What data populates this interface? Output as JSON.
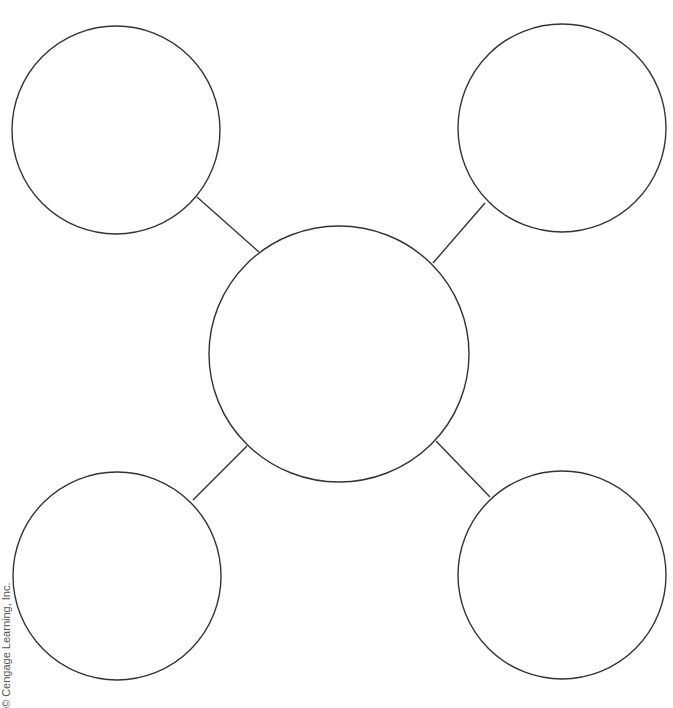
{
  "diagram": {
    "type": "spider-map",
    "stroke_color": "#333333",
    "background": "#ffffff",
    "center_node": {
      "cx": 339,
      "cy": 354,
      "rx": 130,
      "ry": 128,
      "label": ""
    },
    "outer_nodes": [
      {
        "position": "top-left",
        "cx": 116,
        "cy": 130,
        "r": 104,
        "label": ""
      },
      {
        "position": "top-right",
        "cx": 562,
        "cy": 128,
        "r": 104,
        "label": ""
      },
      {
        "position": "bottom-left",
        "cx": 117,
        "cy": 576,
        "r": 104,
        "label": ""
      },
      {
        "position": "bottom-right",
        "cx": 562,
        "cy": 575,
        "r": 104,
        "label": ""
      }
    ],
    "connectors": [
      {
        "from": "top-left",
        "x1": 197,
        "y1": 197,
        "x2": 259,
        "y2": 252
      },
      {
        "from": "top-right",
        "x1": 485,
        "y1": 203,
        "x2": 433,
        "y2": 263
      },
      {
        "from": "bottom-left",
        "x1": 193,
        "y1": 500,
        "x2": 247,
        "y2": 446
      },
      {
        "from": "bottom-right",
        "x1": 490,
        "y1": 497,
        "x2": 436,
        "y2": 441
      }
    ]
  },
  "credit": "© Cengage Learning, Inc."
}
